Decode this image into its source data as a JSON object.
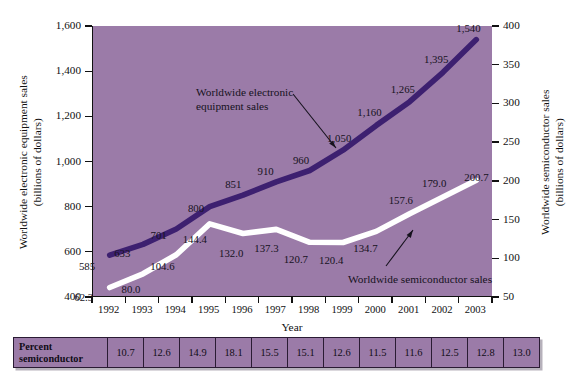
{
  "chart_data": {
    "type": "line",
    "title": "",
    "xlabel": "Year",
    "ylabel_left": "Worldwide electronic equipment sales (billions of dollars)",
    "ylabel_right": "Worldwide semiconductor sales (billions of dollars)",
    "categories": [
      "1992",
      "1993",
      "1994",
      "1995",
      "1996",
      "1997",
      "1998",
      "1999",
      "2000",
      "2001",
      "2002",
      "2003"
    ],
    "ylim_left": [
      400,
      1600
    ],
    "ylim_right": [
      50,
      400
    ],
    "yticks_left": [
      "400",
      "600",
      "800",
      "1,000",
      "1,200",
      "1,400",
      "1,600"
    ],
    "yticks_right": [
      "50",
      "100",
      "150",
      "200",
      "250",
      "300",
      "350",
      "400"
    ],
    "grid": false,
    "legend_position": "inline-annotation",
    "series": [
      {
        "name": "Worldwide electronic equipment sales",
        "axis": "left",
        "color": "#3d2070",
        "values": [
          585,
          633,
          701,
          800,
          851,
          910,
          960,
          1050,
          1160,
          1265,
          1395,
          1540
        ],
        "labels": [
          "585",
          "633",
          "701",
          "800",
          "851",
          "910",
          "960",
          "1,050",
          "1,160",
          "1,265",
          "1,395",
          "1,540"
        ]
      },
      {
        "name": "Worldwide semiconductor sales",
        "axis": "right",
        "color": "#ffffff",
        "values": [
          62.3,
          80.0,
          104.6,
          144.4,
          132.0,
          137.3,
          120.7,
          120.4,
          134.7,
          157.6,
          179.0,
          200.7
        ],
        "labels": [
          "62.3",
          "80.0",
          "104.6",
          "144.4",
          "132.0",
          "137.3",
          "120.7",
          "120.4",
          "134.7",
          "157.6",
          "179.0",
          "200.7"
        ]
      }
    ],
    "annotations": [
      {
        "text_line1": "Worldwide electronic",
        "text_line2": "equipment sales",
        "target": "equipment-series"
      },
      {
        "text_line1": "Worldwide semiconductor sales",
        "text_line2": "",
        "target": "semiconductor-series"
      }
    ],
    "table": {
      "row_header_line1": "Percent",
      "row_header_line2": "semiconductor",
      "values": [
        "10.7",
        "12.6",
        "14.9",
        "18.1",
        "15.5",
        "15.1",
        "12.6",
        "11.5",
        "11.6",
        "12.5",
        "12.8",
        "13.0"
      ]
    },
    "colors": {
      "plot_background": "#9b7ba8",
      "equipment_line": "#3d2070",
      "semiconductor_line": "#ffffff",
      "axis": "#111111",
      "page_background": "#ffffff"
    }
  }
}
